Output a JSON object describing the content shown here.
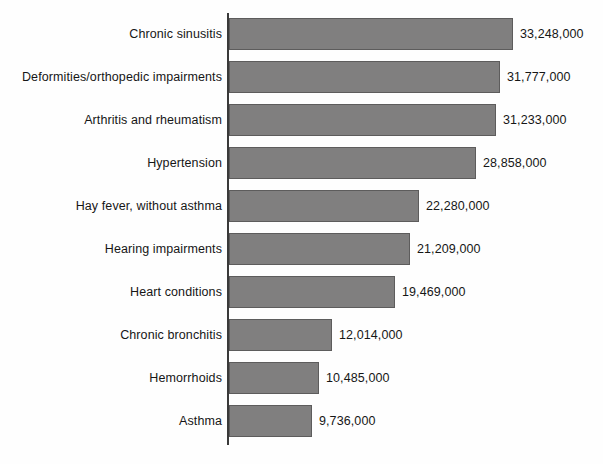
{
  "chart_data": {
    "type": "bar",
    "orientation": "horizontal",
    "title": "",
    "subtitle": "",
    "xlabel": "",
    "ylabel": "",
    "grid": false,
    "legend": null,
    "xlim": [
      0,
      33248000
    ],
    "axis": {
      "category_axis": "vertical-left",
      "value_axis_visible": false,
      "tick_labels": []
    },
    "categories": [
      "Chronic sinusitis",
      "Deformities/orthopedic impairments",
      "Arthritis and rheumatism",
      "Hypertension",
      "Hay fever, without asthma",
      "Hearing impairments",
      "Heart conditions",
      "Chronic bronchitis",
      "Hemorrhoids",
      "Asthma"
    ],
    "values": [
      33248000,
      31777000,
      31233000,
      28858000,
      22280000,
      21209000,
      19469000,
      12014000,
      10485000,
      9736000
    ],
    "value_labels": [
      "33,248,000",
      "31,777,000",
      "31,233,000",
      "28,858,000",
      "22,280,000",
      "21,209,000",
      "19,469,000",
      "12,014,000",
      "10,485,000",
      "9,736,000"
    ],
    "colors": {
      "bar_fill": "#807f7f",
      "bar_stroke": "#5d5c5c",
      "axis": "#3a3a3a",
      "text": "#161616",
      "background": "#fefefe"
    }
  },
  "bars": [
    {
      "label": "Chronic sinusitis",
      "value_label": "33,248,000",
      "value": 33248000
    },
    {
      "label": "Deformities/orthopedic impairments",
      "value_label": "31,777,000",
      "value": 31777000
    },
    {
      "label": "Arthritis and rheumatism",
      "value_label": "31,233,000",
      "value": 31233000
    },
    {
      "label": "Hypertension",
      "value_label": "28,858,000",
      "value": 28858000
    },
    {
      "label": "Hay fever, without asthma",
      "value_label": "22,280,000",
      "value": 22280000
    },
    {
      "label": "Hearing impairments",
      "value_label": "21,209,000",
      "value": 21209000
    },
    {
      "label": "Heart conditions",
      "value_label": "19,469,000",
      "value": 19469000
    },
    {
      "label": "Chronic bronchitis",
      "value_label": "12,014,000",
      "value": 12014000
    },
    {
      "label": "Hemorrhoids",
      "value_label": "10,485,000",
      "value": 10485000
    },
    {
      "label": "Asthma",
      "value_label": "9,736,000",
      "value": 9736000
    }
  ],
  "layout": {
    "axis_x": 229,
    "axis_top": 13,
    "axis_bottom": 445,
    "bar_start_y": 18,
    "bar_height": 32,
    "bar_pitch": 43,
    "max_bar_width": 284,
    "value_gap": 7
  }
}
